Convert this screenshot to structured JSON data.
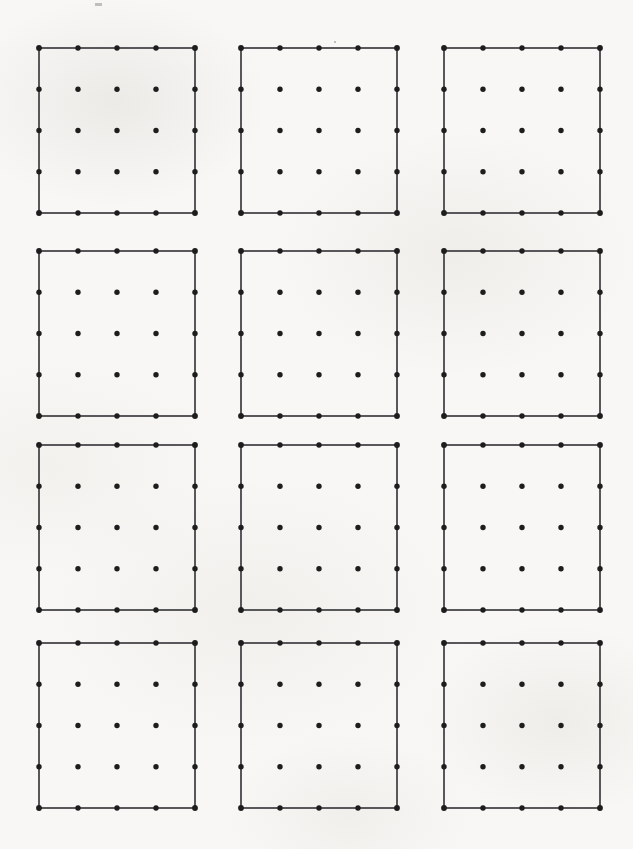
{
  "figure": {
    "title": "",
    "background_color": "#f8f7f5",
    "line_color": "#58585a",
    "dot_color": "#1d1d1d",
    "line_width": 1.1,
    "dot_radius": 2.7,
    "corner_dot_radius": 2.9
  },
  "chart_data": {
    "type": "scatter",
    "title": "",
    "subtitle": "",
    "xlabel": "",
    "ylabel": "",
    "grid": false,
    "legend": null,
    "annotations": [],
    "panel_layout": {
      "rows": 4,
      "cols": 3,
      "total_panels": 12,
      "panel_origin_x": [
        39,
        241,
        444
      ],
      "panel_origin_y": [
        48,
        251,
        445,
        643
      ],
      "panel_width": 156,
      "panel_height": 165
    },
    "lattice": {
      "dots_per_side": 5,
      "dots_per_panel": 25,
      "total_dots": 300,
      "x_step": 39,
      "y_step": 41.25,
      "x_positions_normalized": [
        0,
        0.25,
        0.5,
        0.75,
        1
      ],
      "y_positions_normalized": [
        0,
        0.25,
        0.5,
        0.75,
        1
      ],
      "border": "square outline connecting the four corner dots"
    },
    "axis_ranges": {
      "x": [
        0,
        633
      ],
      "y": [
        0,
        849
      ]
    }
  },
  "marks": {
    "stray": [
      {
        "x": 95,
        "y": 3,
        "w": 7,
        "h": 3
      },
      {
        "x": 334,
        "y": 41,
        "w": 2,
        "h": 2
      }
    ]
  }
}
